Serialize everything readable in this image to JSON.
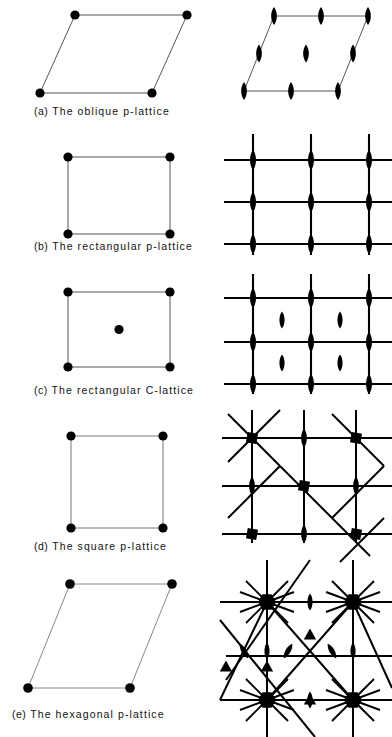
{
  "figure": {
    "title_present": false,
    "ink_color": "#000000",
    "background": "#ffffff"
  },
  "legend_symbols": {
    "lattice_point": "filled-circle",
    "twofold_axis": "filled-lens",
    "threefold_axis": "filled-triangle",
    "fourfold_axis": "filled-square",
    "sixfold_axis": "filled-hexagon",
    "mirror_line": "solid-line"
  },
  "rows": [
    {
      "id": "oblique",
      "caption_tag": "(a)",
      "caption_text": "The oblique p-lattice",
      "lattice": "oblique",
      "centering": "p",
      "cell_shape": "parallelogram",
      "plane_group": "p2",
      "symmetry_elements": {
        "twofold_axes": 9,
        "threefold_axes": 0,
        "fourfold_axes": 0,
        "sixfold_axes": 0,
        "mirror_lines": 0
      }
    },
    {
      "id": "rectangular-p",
      "caption_tag": "(b)",
      "caption_text": "The rectangular p-lattice",
      "lattice": "rectangular",
      "centering": "p",
      "cell_shape": "rectangle",
      "plane_group": "p2mm",
      "symmetry_elements": {
        "twofold_axes": 9,
        "threefold_axes": 0,
        "fourfold_axes": 0,
        "sixfold_axes": 0,
        "mirror_lines": 6
      }
    },
    {
      "id": "rectangular-c",
      "caption_tag": "(c)",
      "caption_text": "The rectangular C-lattice",
      "lattice": "rectangular",
      "centering": "C",
      "cell_shape": "rectangle-with-centre-point",
      "plane_group": "c2mm",
      "symmetry_elements": {
        "twofold_axes": 13,
        "threefold_axes": 0,
        "fourfold_axes": 0,
        "sixfold_axes": 0,
        "mirror_lines": 6
      }
    },
    {
      "id": "square",
      "caption_tag": "(d)",
      "caption_text": "The square p-lattice",
      "lattice": "square",
      "centering": "p",
      "cell_shape": "square",
      "plane_group": "p4mm",
      "symmetry_elements": {
        "twofold_axes": 4,
        "threefold_axes": 0,
        "fourfold_axes": 5,
        "sixfold_axes": 0,
        "mirror_lines": 10
      }
    },
    {
      "id": "hexagonal",
      "caption_tag": "(e)",
      "caption_text": "The hexagonal p-lattice",
      "lattice": "hexagonal",
      "centering": "p",
      "cell_shape": "rhombus-120-degrees",
      "plane_group": "p6mm",
      "symmetry_elements": {
        "twofold_axes": 7,
        "threefold_axes": 4,
        "fourfold_axes": 0,
        "sixfold_axes": 4,
        "mirror_lines": 12
      }
    }
  ]
}
